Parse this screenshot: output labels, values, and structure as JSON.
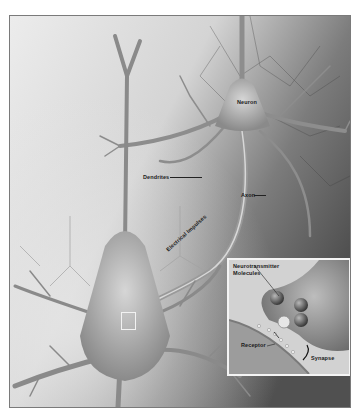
{
  "figure": {
    "colors": {
      "background": "#ffffff",
      "frame_border": "#7a7a7a",
      "tissue_light": "#e4e4e4",
      "tissue_dark": "#5a5a5a",
      "neuron_body": "#a8a8a8",
      "inset_border": "#f4f4f4"
    }
  },
  "labels": {
    "neuron": "Neuron",
    "dendrites": "Dendrites",
    "axon": "Axon",
    "electrical_impulses": "Electrical Impulses"
  },
  "inset": {
    "neurotransmitter_line1": "Neurotransmitter",
    "neurotransmitter_line2": "Molecules",
    "receptor": "Receptor",
    "synapse": "Synapse"
  }
}
